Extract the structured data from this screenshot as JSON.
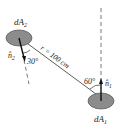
{
  "diagram": {
    "area_top_label": "dA",
    "area_top_sub": "2",
    "area_bottom_label": "dA",
    "area_bottom_sub": "1",
    "normal_top_label": "n̂",
    "normal_top_sub": "2",
    "normal_bottom_label": "n̂",
    "normal_bottom_sub": "1",
    "angle_top": "30°",
    "angle_bottom": "60°",
    "distance_label": "r = 100 cm",
    "colors": {
      "ellipse_fill": "#8c8c8c",
      "ellipse_stroke": "#555555",
      "line": "#333333"
    }
  }
}
